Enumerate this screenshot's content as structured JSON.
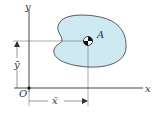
{
  "diagram": {
    "axes": {
      "x_label": "x",
      "y_label": "y",
      "origin_label": "O"
    },
    "point": {
      "label": "A"
    },
    "dimensions": {
      "x_bar": "x̄",
      "y_bar": "ȳ"
    },
    "colors": {
      "region_fill": "#cfe9f2",
      "stroke": "#333333"
    }
  }
}
